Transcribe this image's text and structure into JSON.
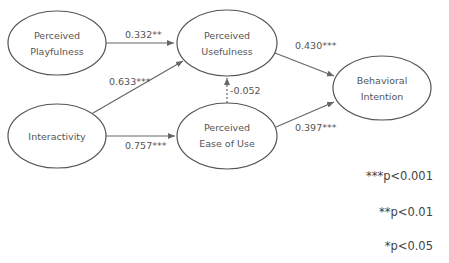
{
  "nodes": {
    "playfulness": {
      "line1": "Perceived",
      "line2": "Playfulness"
    },
    "usefulness": {
      "line1": "Perceived",
      "line2": "Usefulness"
    },
    "interactivity": {
      "line1": "Interactivity"
    },
    "ease_of_use": {
      "line1": "Perceived",
      "line2": "Ease of Use"
    },
    "intention": {
      "line1": "Behavioral",
      "line2": "Intention"
    }
  },
  "paths": {
    "playfulness_to_usefulness": "0.332**",
    "interactivity_to_usefulness": "0.633***",
    "interactivity_to_ease": "0.757***",
    "ease_to_usefulness": "-0.052",
    "usefulness_to_intention": "0.430***",
    "ease_to_intention": "0.397***"
  },
  "legend": {
    "p001": "***p<0.001",
    "p01": "**p<0.01",
    "p05": "*p<0.05"
  },
  "colors": {
    "line": "#666666",
    "text": "#555555"
  }
}
